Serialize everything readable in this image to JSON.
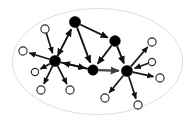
{
  "figure": {
    "caption": "",
    "canvas": {
      "width": 195,
      "height": 122
    },
    "background_color": "#ffffff"
  },
  "boundary": {
    "name": "dotted-ellipse-boundary",
    "shape": "ellipse",
    "center_x": 97.5,
    "center_y": 61.5,
    "radius_x": 85,
    "radius_y": 53,
    "stroke_color": "#a8a8a8",
    "fill_color": "#ffffff",
    "style": "dotted"
  },
  "chart_data": {
    "type": "scatter",
    "xlabel": "",
    "ylabel": "",
    "grid": false,
    "legend": "none",
    "hub_color": "#000000",
    "leaf_color": "#ffffff",
    "edge_color": "#141414",
    "hub_count": 5,
    "leaf_count": 10,
    "edge_count": 23,
    "nodes": [
      {
        "id": "h1",
        "label": "hub-top",
        "x": 75,
        "y": 22,
        "r": 5.6,
        "kind": "hub"
      },
      {
        "id": "h2",
        "label": "hub-left",
        "x": 55,
        "y": 61,
        "r": 5.6,
        "kind": "hub"
      },
      {
        "id": "h3",
        "label": "hub-center",
        "x": 93,
        "y": 70,
        "r": 5.2,
        "kind": "hub"
      },
      {
        "id": "h4",
        "label": "hub-upper-right",
        "x": 115,
        "y": 41,
        "r": 5.4,
        "kind": "hub"
      },
      {
        "id": "h5",
        "label": "hub-right",
        "x": 127,
        "y": 71,
        "r": 5.6,
        "kind": "hub"
      },
      {
        "id": "l1",
        "label": "leaf-upper-left",
        "x": 45,
        "y": 29,
        "r": 4.1,
        "kind": "leaf"
      },
      {
        "id": "l2",
        "label": "leaf-far-left",
        "x": 23,
        "y": 51,
        "r": 4.1,
        "kind": "leaf"
      },
      {
        "id": "l3",
        "label": "leaf-lower-left-a",
        "x": 41,
        "y": 90,
        "r": 4.1,
        "kind": "leaf"
      },
      {
        "id": "l4",
        "label": "leaf-lower-left-b",
        "x": 70,
        "y": 90,
        "r": 4.1,
        "kind": "leaf"
      },
      {
        "id": "l5",
        "label": "leaf-bottom-center",
        "x": 105,
        "y": 98,
        "r": 4.1,
        "kind": "leaf"
      },
      {
        "id": "l6",
        "label": "leaf-bottom-right",
        "x": 138,
        "y": 105,
        "r": 4.1,
        "kind": "leaf"
      },
      {
        "id": "l7",
        "label": "leaf-right-lower",
        "x": 160,
        "y": 78,
        "r": 4.1,
        "kind": "leaf"
      },
      {
        "id": "l8",
        "label": "leaf-upper-right",
        "x": 152,
        "y": 42,
        "r": 4.1,
        "kind": "leaf"
      },
      {
        "id": "l9",
        "label": "leaf-left-mid",
        "x": 35,
        "y": 72,
        "r": 3.6,
        "kind": "leaf"
      },
      {
        "id": "l10",
        "label": "leaf-right-mid",
        "x": 152,
        "y": 62,
        "r": 3.6,
        "kind": "leaf"
      }
    ],
    "edges": [
      {
        "from": "h2",
        "to": "h1",
        "kind": "hub-hub",
        "arrow": "both"
      },
      {
        "from": "h1",
        "to": "h4",
        "kind": "hub-hub",
        "arrow": "to"
      },
      {
        "from": "h1",
        "to": "h3",
        "kind": "hub-hub",
        "arrow": "to"
      },
      {
        "from": "h4",
        "to": "h3",
        "kind": "hub-hub",
        "arrow": "to"
      },
      {
        "from": "h4",
        "to": "h5",
        "kind": "hub-hub",
        "arrow": "to"
      },
      {
        "from": "h3",
        "to": "h2",
        "kind": "hub-hub",
        "arrow": "to"
      },
      {
        "from": "h2",
        "to": "h3",
        "kind": "hub-hub",
        "arrow": "to"
      },
      {
        "from": "h3",
        "to": "h5",
        "kind": "hub-hub-thick",
        "arrow": "to"
      },
      {
        "from": "h2",
        "to": "l1",
        "kind": "hub-leaf",
        "arrow": "from"
      },
      {
        "from": "h2",
        "to": "l2",
        "kind": "hub-leaf",
        "arrow": "to"
      },
      {
        "from": "h2",
        "to": "l3",
        "kind": "hub-leaf",
        "arrow": "to"
      },
      {
        "from": "h2",
        "to": "l4",
        "kind": "hub-leaf",
        "arrow": "to"
      },
      {
        "from": "h2",
        "to": "l9",
        "kind": "hub-leaf",
        "arrow": "to"
      },
      {
        "from": "h5",
        "to": "l5",
        "kind": "hub-leaf",
        "arrow": "to"
      },
      {
        "from": "h5",
        "to": "l6",
        "kind": "hub-leaf",
        "arrow": "to"
      },
      {
        "from": "h5",
        "to": "l7",
        "kind": "hub-leaf",
        "arrow": "to"
      },
      {
        "from": "h5",
        "to": "l8",
        "kind": "hub-leaf",
        "arrow": "to"
      },
      {
        "from": "h5",
        "to": "l10",
        "kind": "hub-leaf",
        "arrow": "from"
      }
    ]
  }
}
